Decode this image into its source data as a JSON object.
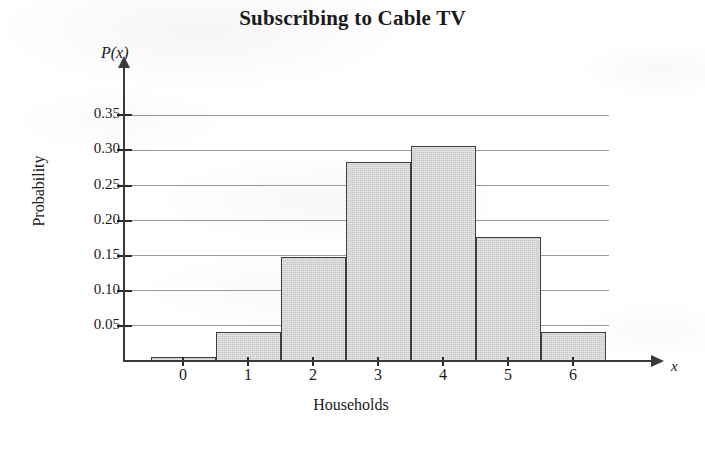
{
  "chart_data": {
    "type": "bar",
    "title": "Subscribing to Cable TV",
    "xlabel": "Households",
    "ylabel": "Probability",
    "x_axis_symbol": "x",
    "y_axis_symbol": "P(x)",
    "categories": [
      "0",
      "1",
      "2",
      "3",
      "4",
      "5",
      "6"
    ],
    "values": [
      0.005,
      0.042,
      0.148,
      0.283,
      0.306,
      0.177,
      0.042
    ],
    "ytick_labels": [
      "0.05",
      "0.10",
      "0.15",
      "0.20",
      "0.25",
      "0.30",
      "0.35"
    ],
    "ytick_values": [
      0.05,
      0.1,
      0.15,
      0.2,
      0.25,
      0.3,
      0.35
    ],
    "ylim": [
      0,
      0.39
    ],
    "xlim": [
      -0.5,
      6.5
    ],
    "grid": true,
    "grid_axis": "y",
    "legend": false,
    "bar_fill_color": "#c6c6c6",
    "bar_edge_color": "#3d3d3d",
    "axis_color": "#3a3a3a",
    "gridline_color": "#9a9a9a",
    "background_color": "#ffffff"
  }
}
